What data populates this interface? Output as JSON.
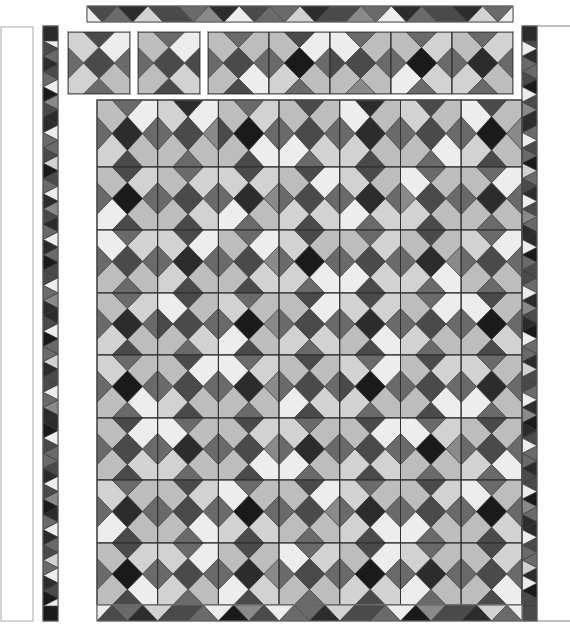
{
  "diagram": {
    "palette": [
      "#ededed",
      "#d2d2d2",
      "#bdbdbd",
      "#8a8a8a",
      "#6a6a6a",
      "#4a4a4a",
      "#2c2c2c",
      "#1a1a1a"
    ],
    "stroke": "#3a3a3a",
    "frame_stroke": "#a8a8a8",
    "block_layout": [
      "corner_tl",
      "corner_tr",
      "corner_br",
      "corner_bl",
      "center",
      "edge_t",
      "edge_r",
      "edge_b",
      "edge_l"
    ],
    "left_panel": {
      "x": 1,
      "y": 27,
      "w": 32,
      "h": 594
    },
    "right_line": {
      "x1": 537,
      "y1": 26,
      "x2": 570,
      "y2": 26
    },
    "bottom_line": {
      "x1": 537,
      "y1": 621,
      "x2": 570,
      "y2": 621
    },
    "top_strip": {
      "x": 87,
      "y": 6,
      "w": 426,
      "h": 16,
      "down": [
        5,
        6,
        5,
        4,
        6,
        5,
        4,
        6,
        5,
        4,
        6,
        5,
        6,
        4
      ],
      "up": [
        0,
        4,
        1,
        5,
        3,
        0,
        4,
        1,
        5,
        3,
        0,
        4,
        5,
        1,
        0
      ]
    },
    "left_strip": {
      "x": 43,
      "y": 26,
      "w": 15,
      "h": 595,
      "cap_top": 6,
      "cap_bottom": 7,
      "right_pointing": [
        5,
        6,
        4,
        7,
        5,
        6,
        4,
        5,
        7,
        4,
        6,
        5,
        4,
        6,
        7,
        5,
        4,
        6,
        5,
        7,
        4,
        6,
        5,
        4,
        6,
        7,
        5,
        4,
        6,
        5,
        7,
        4,
        6,
        5,
        4,
        6,
        7
      ],
      "left_pointing": [
        0,
        4,
        5,
        0,
        3,
        6,
        0,
        4,
        1,
        5,
        0,
        3,
        6,
        0,
        4,
        5,
        0,
        3,
        6,
        0,
        4,
        1,
        5,
        0,
        3,
        6,
        0,
        4,
        5,
        0,
        3,
        6,
        0,
        4,
        1,
        0,
        5
      ]
    },
    "right_strip": {
      "x": 522,
      "y": 26,
      "w": 15,
      "h": 595,
      "cap_top": 6,
      "cap_bottom": 5,
      "right_pointing": [
        0,
        4,
        5,
        0,
        3,
        6,
        0,
        4,
        1,
        5,
        0,
        3,
        6,
        0,
        4,
        5,
        0,
        3,
        6,
        0,
        4,
        1,
        5,
        0,
        3,
        6,
        0,
        4,
        5,
        0,
        3,
        6,
        0,
        4,
        1,
        0,
        5
      ],
      "left_pointing": [
        5,
        6,
        4,
        7,
        5,
        6,
        4,
        5,
        7,
        4,
        6,
        5,
        4,
        6,
        7,
        5,
        4,
        6,
        5,
        7,
        4,
        6,
        5,
        4,
        6,
        7,
        5,
        4,
        6,
        5,
        7,
        4,
        6,
        5,
        4,
        6,
        7
      ]
    },
    "bottom_strip": {
      "x": 97,
      "y": 605,
      "w": 425,
      "h": 16,
      "up": [
        5,
        6,
        5,
        4,
        7,
        5,
        4,
        6,
        5,
        4,
        7,
        5,
        6,
        4
      ],
      "down": [
        0,
        4,
        1,
        5,
        0,
        3,
        0,
        4,
        1,
        5,
        0,
        3,
        5,
        1,
        0
      ]
    },
    "top_blocks": [
      {
        "x": 68,
        "y": 32,
        "s": 62,
        "c": [
          1,
          0,
          2,
          1,
          5,
          5,
          4,
          4,
          4
        ]
      },
      {
        "x": 138,
        "y": 32,
        "s": 62,
        "c": [
          2,
          0,
          1,
          2,
          5,
          4,
          5,
          5,
          4
        ]
      }
    ],
    "top_row_strip": {
      "x": 208,
      "y": 32,
      "s": 61,
      "count": 5,
      "blocks": [
        [
          2,
          2,
          0,
          2,
          5,
          4,
          4,
          5,
          4
        ],
        [
          2,
          0,
          2,
          1,
          7,
          5,
          4,
          4,
          4
        ],
        [
          0,
          2,
          2,
          2,
          5,
          4,
          4,
          3,
          5
        ],
        [
          2,
          1,
          1,
          0,
          7,
          4,
          4,
          4,
          4
        ],
        [
          2,
          1,
          2,
          1,
          6,
          4,
          4,
          4,
          4
        ]
      ]
    },
    "main_grid": {
      "x": 97,
      "y": 100,
      "cols": 7,
      "rows": 8,
      "cw": 60.7,
      "rh": [
        67,
        63,
        63,
        62,
        63,
        62,
        63,
        62
      ],
      "blocks": [
        [
          [
            2,
            0,
            2,
            1,
            6,
            4,
            4,
            5,
            4
          ],
          [
            1,
            0,
            2,
            2,
            5,
            6,
            3,
            4,
            4
          ],
          [
            2,
            1,
            0,
            2,
            7,
            4,
            4,
            5,
            5
          ],
          [
            2,
            2,
            1,
            0,
            5,
            5,
            4,
            4,
            4
          ],
          [
            0,
            2,
            2,
            1,
            6,
            6,
            4,
            5,
            4
          ],
          [
            1,
            2,
            0,
            2,
            5,
            5,
            4,
            4,
            4
          ],
          [
            0,
            2,
            2,
            1,
            7,
            5,
            3,
            5,
            4
          ]
        ],
        [
          [
            2,
            1,
            2,
            0,
            7,
            5,
            4,
            5,
            4
          ],
          [
            2,
            1,
            1,
            2,
            5,
            4,
            4,
            5,
            4
          ],
          [
            1,
            1,
            2,
            0,
            6,
            5,
            3,
            4,
            4
          ],
          [
            2,
            0,
            1,
            1,
            5,
            5,
            4,
            5,
            4
          ],
          [
            1,
            2,
            1,
            0,
            6,
            5,
            4,
            4,
            4
          ],
          [
            0,
            2,
            2,
            1,
            5,
            4,
            4,
            5,
            3
          ],
          [
            2,
            0,
            2,
            2,
            6,
            4,
            4,
            4,
            4
          ]
        ],
        [
          [
            0,
            1,
            2,
            2,
            5,
            4,
            4,
            4,
            4
          ],
          [
            1,
            0,
            2,
            1,
            6,
            5,
            4,
            5,
            4
          ],
          [
            2,
            0,
            1,
            2,
            5,
            4,
            3,
            5,
            4
          ],
          [
            1,
            2,
            0,
            1,
            7,
            5,
            4,
            4,
            4
          ],
          [
            2,
            1,
            1,
            0,
            5,
            4,
            4,
            5,
            4
          ],
          [
            2,
            2,
            0,
            1,
            6,
            5,
            3,
            4,
            4
          ],
          [
            1,
            0,
            2,
            2,
            5,
            4,
            4,
            4,
            4
          ]
        ],
        [
          [
            2,
            1,
            2,
            1,
            6,
            4,
            4,
            5,
            4
          ],
          [
            0,
            2,
            1,
            2,
            5,
            5,
            4,
            4,
            5
          ],
          [
            1,
            2,
            2,
            0,
            7,
            4,
            3,
            5,
            4
          ],
          [
            2,
            0,
            1,
            1,
            5,
            5,
            4,
            4,
            4
          ],
          [
            1,
            1,
            0,
            2,
            6,
            5,
            4,
            5,
            4
          ],
          [
            2,
            0,
            2,
            1,
            5,
            4,
            4,
            4,
            4
          ],
          [
            0,
            2,
            1,
            2,
            7,
            5,
            4,
            5,
            4
          ]
        ],
        [
          [
            1,
            2,
            0,
            2,
            7,
            4,
            4,
            4,
            4
          ],
          [
            2,
            0,
            2,
            1,
            5,
            5,
            4,
            5,
            4
          ],
          [
            0,
            1,
            2,
            2,
            6,
            4,
            3,
            4,
            4
          ],
          [
            2,
            2,
            1,
            0,
            5,
            5,
            4,
            5,
            4
          ],
          [
            1,
            0,
            2,
            1,
            7,
            4,
            4,
            4,
            5
          ],
          [
            2,
            1,
            0,
            2,
            5,
            5,
            4,
            5,
            4
          ],
          [
            1,
            2,
            2,
            0,
            6,
            4,
            4,
            4,
            4
          ]
        ],
        [
          [
            2,
            0,
            1,
            2,
            5,
            5,
            4,
            5,
            4
          ],
          [
            0,
            2,
            2,
            1,
            6,
            4,
            4,
            4,
            4
          ],
          [
            2,
            1,
            0,
            2,
            5,
            5,
            3,
            5,
            4
          ],
          [
            1,
            2,
            2,
            0,
            6,
            4,
            4,
            4,
            4
          ],
          [
            2,
            0,
            1,
            1,
            5,
            5,
            4,
            5,
            4
          ],
          [
            0,
            1,
            2,
            2,
            7,
            4,
            3,
            4,
            4
          ],
          [
            2,
            2,
            0,
            1,
            5,
            5,
            4,
            4,
            4
          ]
        ],
        [
          [
            1,
            2,
            2,
            0,
            6,
            4,
            4,
            5,
            4
          ],
          [
            2,
            1,
            0,
            2,
            5,
            5,
            4,
            4,
            4
          ],
          [
            0,
            2,
            1,
            1,
            7,
            4,
            4,
            5,
            4
          ],
          [
            2,
            0,
            2,
            2,
            5,
            5,
            3,
            4,
            4
          ],
          [
            1,
            2,
            0,
            1,
            6,
            4,
            4,
            5,
            4
          ],
          [
            2,
            1,
            2,
            0,
            5,
            5,
            4,
            4,
            4
          ],
          [
            0,
            2,
            1,
            2,
            7,
            4,
            4,
            5,
            4
          ]
        ],
        [
          [
            2,
            1,
            0,
            2,
            7,
            5,
            4,
            5,
            4
          ],
          [
            1,
            0,
            2,
            1,
            5,
            4,
            4,
            4,
            4
          ],
          [
            2,
            2,
            1,
            0,
            6,
            5,
            3,
            5,
            4
          ],
          [
            0,
            1,
            2,
            2,
            5,
            4,
            4,
            4,
            4
          ],
          [
            2,
            0,
            1,
            1,
            7,
            5,
            4,
            5,
            4
          ],
          [
            1,
            2,
            2,
            0,
            6,
            4,
            4,
            4,
            4
          ],
          [
            2,
            1,
            0,
            2,
            5,
            5,
            4,
            5,
            4
          ]
        ]
      ]
    }
  }
}
